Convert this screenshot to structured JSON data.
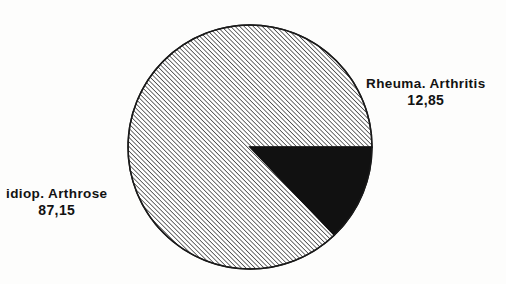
{
  "chart_data": {
    "type": "pie",
    "title": "",
    "subtitle": "",
    "xlabel": "",
    "ylabel": "",
    "legend_position": "none",
    "grid": false,
    "units": "percent",
    "decimal_separator": ",",
    "total": 100.0,
    "start_angle_deg": 0,
    "direction": "counterclockwise",
    "categories": [
      "idiop. Arthrose",
      "Rheuma. Arthritis"
    ],
    "values": [
      87.15,
      12.85
    ],
    "value_labels": [
      "87,15",
      "12,85"
    ],
    "slices": [
      {
        "label": "idiop. Arthrose",
        "value": 87.15,
        "value_label": "87,15",
        "fill": "hatch-diagonal",
        "color": "#ffffff",
        "stroke": "#1a1a1a",
        "sweep_deg": 313.74,
        "label_position": "left-outside"
      },
      {
        "label": "Rheuma. Arthritis",
        "value": 12.85,
        "value_label": "12,85",
        "fill": "solid",
        "color": "#111111",
        "stroke": "#111111",
        "sweep_deg": 46.26,
        "label_position": "right-outside"
      }
    ]
  },
  "labels": {
    "rheuma": {
      "name": "Rheuma. Arthritis",
      "value": "12,85"
    },
    "idiop": {
      "name": "idiop. Arthrose",
      "value": "87,15"
    }
  },
  "geometry": {
    "center_x": 250,
    "center_y": 147,
    "radius": 122
  },
  "colors": {
    "background": "#fdfdfc",
    "outline": "#1a1a1a",
    "slice_solid": "#111111",
    "slice_hatch_line": "#2b2b2b",
    "text": "#121212"
  }
}
